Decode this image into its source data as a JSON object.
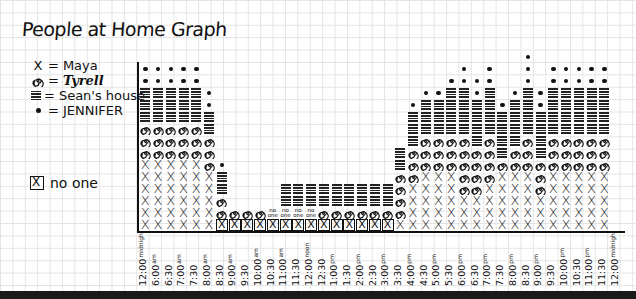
{
  "title": "People at Home Graph",
  "legend": [
    {
      "symbol": "x",
      "label": "Maya"
    },
    {
      "symbol": "spiral",
      "label": "Tyrell"
    },
    {
      "symbol": "lines",
      "label": "Sean's house"
    },
    {
      "symbol": "dot",
      "label": "JENNIFER"
    }
  ],
  "legend_none": {
    "symbol": "boxed-x",
    "label": "no one"
  },
  "chart_data": {
    "type": "stacked-pictogram",
    "title": "People at Home Graph",
    "xlabel": "",
    "ylabel": "",
    "categories": [
      "12:00 midnight",
      "6:00 am",
      "6:30",
      "7:00 am",
      "7:30",
      "8:00 am",
      "8:30",
      "9:00 am",
      "9:30",
      "10:00 am",
      "10:30",
      "11:00 am",
      "11:30",
      "12:00 noon",
      "12:30",
      "1:00 pm",
      "1:30",
      "2:00 pm",
      "2:30",
      "3:00 pm",
      "3:30",
      "4:00 pm",
      "4:30",
      "5:00 pm",
      "5:30",
      "6:00 pm",
      "6:30",
      "7:00 pm",
      "7:30",
      "8:00 pm",
      "8:30",
      "9:00 pm",
      "9:30",
      "10:00 pm",
      "10:30",
      "11:00 pm",
      "11:30",
      "12:00 midnight"
    ],
    "series": [
      {
        "name": "Maya",
        "symbol": "X",
        "values": [
          6,
          6,
          6,
          6,
          6,
          5,
          1,
          0,
          0,
          0,
          0,
          0,
          0,
          0,
          0,
          0,
          0,
          0,
          0,
          0,
          1,
          4,
          5,
          5,
          5,
          3,
          3,
          4,
          5,
          5,
          5,
          3,
          5,
          5,
          5,
          5,
          5,
          5
        ]
      },
      {
        "name": "Tyrell",
        "symbol": "spiral",
        "values": [
          3,
          3,
          3,
          3,
          3,
          3,
          2,
          1,
          1,
          1,
          0,
          0,
          0,
          1,
          1,
          1,
          1,
          1,
          1,
          1,
          4,
          3,
          3,
          3,
          3,
          4,
          4,
          4,
          1,
          2,
          3,
          3,
          3,
          3,
          3,
          3,
          3,
          0
        ]
      },
      {
        "name": "Sean's house",
        "symbol": "lines",
        "values": [
          3,
          3,
          3,
          3,
          3,
          2,
          2,
          0,
          0,
          0,
          0,
          2,
          2,
          2,
          2,
          2,
          2,
          2,
          2,
          2,
          2,
          3,
          3,
          3,
          4,
          4,
          4,
          4,
          4,
          4,
          4,
          3,
          4,
          4,
          4,
          4,
          4,
          0
        ]
      },
      {
        "name": "JENNIFER",
        "symbol": "dot",
        "values": [
          2,
          2,
          2,
          2,
          2,
          1,
          1,
          0,
          0,
          0,
          0,
          0,
          0,
          0,
          0,
          0,
          0,
          0,
          0,
          0,
          0,
          1,
          1,
          1,
          1,
          2,
          2,
          2,
          1,
          1,
          3,
          2,
          2,
          2,
          2,
          2,
          2,
          0
        ]
      },
      {
        "name": "no one",
        "symbol": "boxed X",
        "values": [
          0,
          0,
          0,
          0,
          0,
          0,
          1,
          1,
          1,
          1,
          1,
          1,
          1,
          1,
          1,
          1,
          1,
          1,
          1,
          1,
          0,
          0,
          0,
          0,
          0,
          0,
          0,
          0,
          0,
          0,
          0,
          0,
          0,
          0,
          0,
          0,
          0,
          0
        ]
      }
    ],
    "annotations": [
      "no one",
      "no one",
      "no one",
      "no one"
    ],
    "grid": true
  },
  "columns": [
    {
      "t": "12:00",
      "s": "midnight",
      "c": "xxxxxxssshhhdd"
    },
    {
      "t": "6:00",
      "s": "am",
      "c": "xxxxxxssshhhdd"
    },
    {
      "t": "6:30",
      "s": "",
      "c": "xxxxxxssshhhdd"
    },
    {
      "t": "7:00",
      "s": "am",
      "c": "xxxxxxssshhhdd"
    },
    {
      "t": "7:30",
      "s": "",
      "c": "xxxxxxssshhhdd"
    },
    {
      "t": "8:00",
      "s": "am",
      "c": "xxxxxssshhdd"
    },
    {
      "t": "8:30",
      "s": "",
      "c": "nsshhd"
    },
    {
      "t": "9:00",
      "s": "am",
      "c": "ns"
    },
    {
      "t": "9:30",
      "s": "",
      "c": "ns"
    },
    {
      "t": "10:00",
      "s": "am",
      "c": "ns"
    },
    {
      "t": "10:30",
      "s": "",
      "c": "no"
    },
    {
      "t": "11:00",
      "s": "am",
      "c": "nohh"
    },
    {
      "t": "11:30",
      "s": "",
      "c": "nohh"
    },
    {
      "t": "12:00",
      "s": "noon",
      "c": "nohh"
    },
    {
      "t": "12:30",
      "s": "",
      "c": "nshh"
    },
    {
      "t": "1:00",
      "s": "pm",
      "c": "nshh"
    },
    {
      "t": "1:30",
      "s": "",
      "c": "nshh"
    },
    {
      "t": "2:00",
      "s": "pm",
      "c": "nshh"
    },
    {
      "t": "2:30",
      "s": "",
      "c": "nshh"
    },
    {
      "t": "3:00",
      "s": "pm",
      "c": "nshh"
    },
    {
      "t": "3:30",
      "s": "",
      "c": "xsssshh"
    },
    {
      "t": "4:00",
      "s": "pm",
      "c": "xxxxssshhhd"
    },
    {
      "t": "4:30",
      "s": "",
      "c": "xxxxxssshhhd"
    },
    {
      "t": "5:00",
      "s": "pm",
      "c": "xxxxxssshhhd"
    },
    {
      "t": "5:30",
      "s": "",
      "c": "xxxxxssshhhhd"
    },
    {
      "t": "6:00",
      "s": "pm",
      "c": "xxxssssshhhhdd"
    },
    {
      "t": "6:30",
      "s": "",
      "c": "xxxsssshhhhdd"
    },
    {
      "t": "7:00",
      "s": "pm",
      "c": "xxxxsssshhhhdd"
    },
    {
      "t": "7:30",
      "s": "",
      "c": "xxxxxshhhhd"
    },
    {
      "t": "8:00",
      "s": "pm",
      "c": "xxxxxsshhhhd"
    },
    {
      "t": "8:30",
      "s": "",
      "c": "xxxxxssshhhhddd"
    },
    {
      "t": "9:00",
      "s": "pm",
      "c": "xxxssshhhhdd"
    },
    {
      "t": "9:30",
      "s": "",
      "c": "xxxxxssshhhhdd"
    },
    {
      "t": "10:00",
      "s": "pm",
      "c": "xxxxxssshhhhdd"
    },
    {
      "t": "10:30",
      "s": "",
      "c": "xxxxxssshhhhdd"
    },
    {
      "t": "11:00",
      "s": "pm",
      "c": "xxxxxssshhhhdd"
    },
    {
      "t": "11:30",
      "s": "",
      "c": "xxxxxssshhhhdd"
    },
    {
      "t": "12:00",
      "s": "midnight",
      "c": ""
    }
  ],
  "colors": {
    "ink": "#111111",
    "grid": "#e4e4e4",
    "paper": "#ffffff"
  }
}
